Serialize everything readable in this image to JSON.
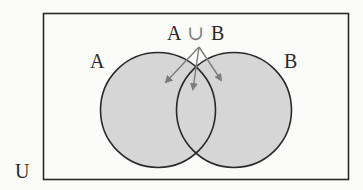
{
  "diagram": {
    "type": "venn",
    "universe_label": "U",
    "set_a_label": "A",
    "set_b_label": "B",
    "union_label": {
      "left": "A",
      "operator": "∪",
      "right": "B"
    },
    "shaded_region": "A ∪ B",
    "colors": {
      "background": "#fbfbfa",
      "stroke": "#2a2a2a",
      "fill": "#d6d6d6",
      "arrow": "#7c7c7c",
      "operator": "#7a7a7a"
    }
  }
}
